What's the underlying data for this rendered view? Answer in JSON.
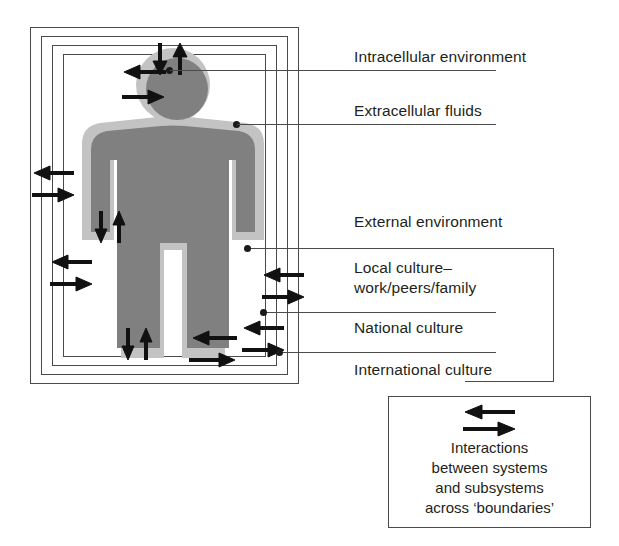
{
  "diagram": {
    "title_hidden": "",
    "colors": {
      "line": "#4a4a4a",
      "body_fill": "#808080",
      "halo_fill": "#c0c0c0",
      "arrow": "#1a1a1a",
      "text": "#231f20",
      "background": "#ffffff"
    },
    "boundaries": [
      {
        "name": "intracellular-environment",
        "order": 1
      },
      {
        "name": "extracellular-fluids",
        "order": 2
      },
      {
        "name": "external-environment",
        "order": 3
      },
      {
        "name": "local-culture",
        "order": 4
      },
      {
        "name": "national-culture",
        "order": 5
      },
      {
        "name": "international-culture",
        "order": 6
      }
    ],
    "callouts": [
      {
        "id": "intracellular",
        "label": "Intracellular environment",
        "lines": [
          "Intracellular environment"
        ]
      },
      {
        "id": "extracellular",
        "label": "Extracellular fluids",
        "lines": [
          "Extracellular fluids"
        ]
      },
      {
        "id": "external",
        "label": "External environment",
        "lines": [
          "External environment"
        ]
      },
      {
        "id": "local",
        "label": "Local culture–work/peers/family",
        "lines": [
          "Local culture–",
          "work/peers/family"
        ]
      },
      {
        "id": "national",
        "label": "National culture",
        "lines": [
          "National culture"
        ]
      },
      {
        "id": "international",
        "label": "International culture",
        "lines": [
          "International culture"
        ]
      }
    ],
    "legend": {
      "icon": "bidirectional-arrows",
      "lines": [
        "Interactions",
        "between systems",
        "and subsystems",
        "across ‘boundaries’"
      ],
      "text": "Interactions between systems and subsystems across ‘boundaries’"
    },
    "arrow_groups": [
      {
        "name": "head-vertical-arrows",
        "direction": "down-up",
        "location": "head-top"
      },
      {
        "name": "head-horizontal-arrows",
        "direction": "left-right",
        "location": "head-left"
      },
      {
        "name": "arm-vertical-arrows",
        "direction": "down-up",
        "location": "left-arm"
      },
      {
        "name": "leg-vertical-arrows",
        "direction": "down-up",
        "location": "left-leg"
      },
      {
        "name": "leg-horizontal-arrows",
        "direction": "left-right",
        "location": "right-leg"
      },
      {
        "name": "outer-left-arrows",
        "direction": "left-right",
        "location": "left-boundaries"
      },
      {
        "name": "outer-left-lower-arrows",
        "direction": "left-right",
        "location": "left-boundaries-lower"
      },
      {
        "name": "outer-right-upper-arrows",
        "direction": "left-right",
        "location": "right-boundaries-upper"
      },
      {
        "name": "outer-right-lower-arrows",
        "direction": "left-right",
        "location": "right-boundaries-lower"
      }
    ]
  }
}
